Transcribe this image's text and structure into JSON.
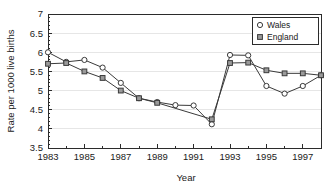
{
  "chart_data": {
    "type": "line",
    "title": "",
    "xlabel": "Year",
    "ylabel": "Rate per 1000 live births",
    "xlim": [
      1983,
      1998
    ],
    "ylim": [
      3.5,
      7
    ],
    "grid": true,
    "legend_position": "top-right",
    "x": [
      1983,
      1984,
      1985,
      1986,
      1987,
      1988,
      1989,
      1990,
      1991,
      1992,
      1993,
      1994,
      1995,
      1996,
      1997,
      1998
    ],
    "y_ticks": [
      3.5,
      4,
      4.5,
      5,
      5.5,
      6,
      6.5,
      7
    ],
    "y_tick_labels": [
      "3.5",
      "4",
      "4.5",
      "5",
      "5.5",
      "6",
      "6.5",
      "7"
    ],
    "x_ticks": [
      1983,
      1985,
      1987,
      1989,
      1991,
      1993,
      1995,
      1997
    ],
    "x_tick_labels": [
      "1983",
      "1985",
      "1987",
      "1989",
      "1991",
      "1993",
      "1995",
      "1997"
    ],
    "x_minor_ticks": [
      1984,
      1986,
      1988,
      1990,
      1992,
      1994,
      1996,
      1998
    ],
    "series": [
      {
        "name": "Wales",
        "marker": "open-circle",
        "color": "#3a3a3a",
        "x": [
          1983,
          1984,
          1985,
          1986,
          1987,
          1988,
          1989,
          1990,
          1991,
          1992,
          1993,
          1994,
          1995,
          1996,
          1997,
          1998
        ],
        "values": [
          6.0,
          5.75,
          5.8,
          5.6,
          5.2,
          4.8,
          4.7,
          4.62,
          4.61,
          4.12,
          5.93,
          5.92,
          5.12,
          4.92,
          5.12,
          5.4
        ]
      },
      {
        "name": "England",
        "marker": "filled-square",
        "color": "#9a9a9a",
        "x": [
          1983,
          1984,
          1985,
          1986,
          1987,
          1988,
          1989,
          1992,
          1993,
          1994,
          1995,
          1996,
          1997,
          1998
        ],
        "values": [
          5.7,
          5.72,
          5.5,
          5.33,
          5.0,
          4.8,
          4.68,
          4.25,
          5.72,
          5.73,
          5.53,
          5.45,
          5.45,
          5.4
        ]
      }
    ]
  },
  "legend": {
    "items": [
      {
        "label": "Wales",
        "marker": "open-circle"
      },
      {
        "label": "England",
        "marker": "filled-square"
      }
    ]
  },
  "axes": {
    "x_title": "Year",
    "y_title": "Rate per 1000 live births"
  }
}
